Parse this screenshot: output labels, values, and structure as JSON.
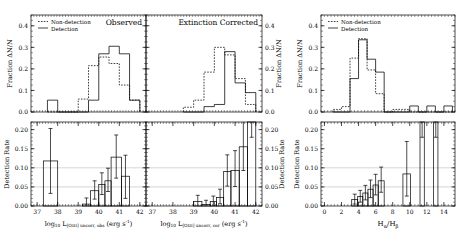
{
  "figure": {
    "width": 463,
    "height": 234,
    "background": "#ffffff",
    "axis_color": "#000000",
    "grid_color": "#bbbbbb",
    "nondetection_style": "dotted",
    "detection_style": "solid"
  },
  "legend": {
    "nondetection_label": "Non-detection",
    "detection_label": "Detection"
  },
  "panels": {
    "left": {
      "title": "Observed",
      "top": {
        "ylabel": "Fraction ΔN/N",
        "yticks": [
          "0.0",
          "0.1",
          "0.2",
          "0.3",
          "0.4"
        ],
        "ylim": [
          0.0,
          0.45
        ]
      },
      "bottom": {
        "ylabel": "Detection Rate",
        "yticks": [
          "0.00",
          "0.05",
          "0.10",
          "0.15",
          "0.20"
        ],
        "ylim": [
          0.0,
          0.22
        ],
        "gridlines": [
          0.05,
          0.1
        ]
      },
      "xlabel_main": "log",
      "xlabel_sub": "10",
      "xlabel_l": "L",
      "xlabel_lsub": "[OIII] uncorr, obs",
      "xlabel_unit": "(erg s",
      "xlabel_unitexp": "-1",
      "xlabel_unitend": ")",
      "xticks": [
        "37",
        "38",
        "39",
        "40",
        "41",
        "42"
      ],
      "xlim": [
        36.7,
        42.3
      ]
    },
    "middle": {
      "title": "Extinction Corrected",
      "top": {
        "ylabel": "Fraction ΔN/N",
        "yticks": [
          "0.0",
          "0.1",
          "0.2",
          "0.3",
          "0.4"
        ],
        "ylim": [
          0.0,
          0.45
        ]
      },
      "bottom": {
        "ylabel": "Detection Rate",
        "yticks": [
          "0.00",
          "0.05",
          "0.10",
          "0.15",
          "0.20"
        ],
        "ylim": [
          0.0,
          0.22
        ],
        "gridlines": [
          0.05,
          0.1
        ]
      },
      "xlabel_main": "log",
      "xlabel_sub": "10",
      "xlabel_l": "L",
      "xlabel_lsub": "[OIII] uncorr, cor",
      "xlabel_unit": "(erg s",
      "xlabel_unitexp": "-1",
      "xlabel_unitend": ")",
      "xticks": [
        "37",
        "38",
        "39",
        "40",
        "41",
        "42"
      ],
      "xlim": [
        36.7,
        42.3
      ]
    },
    "right": {
      "title": "",
      "top": {
        "ylabel": "Fraction ΔN/N",
        "yticks": [
          "0.0",
          "0.1",
          "0.2",
          "0.3",
          "0.4"
        ],
        "ylim": [
          0.0,
          0.45
        ]
      },
      "bottom": {
        "ylabel": "Detection Rate",
        "yticks": [
          "0.00",
          "0.05",
          "0.10",
          "0.15",
          "0.20"
        ],
        "ylim": [
          0.0,
          0.22
        ],
        "gridlines": [
          0.05,
          0.1
        ]
      },
      "xlabel_h": "H",
      "xlabel_hsub1": "α",
      "xlabel_slash": "/H",
      "xlabel_hsub2": "β",
      "xticks": [
        "0",
        "2",
        "4",
        "6",
        "8",
        "10",
        "12",
        "14"
      ],
      "xlim": [
        -0.4,
        15.3
      ]
    }
  },
  "chart_data": [
    {
      "type": "line",
      "id": "left-top-histogram",
      "title": "Observed",
      "xlabel": "log10 L[OIII] uncorr, obs (erg s-1)",
      "ylabel": "Fraction ΔN/N",
      "xlim": [
        36.7,
        42.3
      ],
      "ylim": [
        0.0,
        0.45
      ],
      "grid": false,
      "legend_position": "top-left",
      "bin_edges": [
        37.5,
        38.0,
        38.5,
        39.0,
        39.5,
        40.0,
        40.5,
        41.0,
        41.5,
        42.0
      ],
      "series": [
        {
          "name": "Non-detection",
          "style": "dotted",
          "values": [
            0.0,
            0.0,
            0.0,
            0.06,
            0.215,
            0.255,
            0.225,
            0.125,
            0.055
          ]
        },
        {
          "name": "Detection",
          "style": "solid",
          "values": [
            0.055,
            0.0,
            0.0,
            0.0,
            0.055,
            0.27,
            0.305,
            0.27,
            0.055
          ]
        }
      ]
    },
    {
      "type": "bar",
      "id": "left-bottom-detection-rate",
      "xlabel": "log10 L[OIII] uncorr, obs (erg s-1)",
      "ylabel": "Detection Rate",
      "xlim": [
        36.7,
        42.3
      ],
      "ylim": [
        0.0,
        0.22
      ],
      "grid": true,
      "gridlines": [
        0.05,
        0.1
      ],
      "bin_edges": [
        37.3,
        38.0,
        39.2,
        39.6,
        40.0,
        40.3,
        40.6,
        41.1,
        41.5
      ],
      "values": [
        0.118,
        0.0,
        0.005,
        0.04,
        0.056,
        0.066,
        0.128,
        0.078
      ],
      "err_low": [
        0.085,
        0.0,
        0.005,
        0.022,
        0.026,
        0.028,
        0.055,
        0.058
      ],
      "err_high": [
        0.085,
        0.0,
        0.016,
        0.026,
        0.031,
        0.033,
        0.058,
        0.055
      ]
    },
    {
      "type": "line",
      "id": "middle-top-histogram",
      "title": "Extinction Corrected",
      "xlabel": "log10 L[OIII] uncorr, cor (erg s-1)",
      "ylabel": "Fraction ΔN/N",
      "xlim": [
        36.7,
        42.3
      ],
      "ylim": [
        0.0,
        0.45
      ],
      "grid": false,
      "bin_edges": [
        38.5,
        39.0,
        39.5,
        40.0,
        40.5,
        41.0,
        41.5,
        42.0
      ],
      "series": [
        {
          "name": "Non-detection",
          "style": "dotted",
          "values": [
            0.022,
            0.055,
            0.185,
            0.3,
            0.265,
            0.155,
            0.035
          ]
        },
        {
          "name": "Detection",
          "style": "solid",
          "values": [
            0.0,
            0.0,
            0.025,
            0.035,
            0.28,
            0.135,
            0.09
          ]
        }
      ]
    },
    {
      "type": "bar",
      "id": "middle-bottom-detection-rate",
      "xlabel": "log10 L[OIII] uncorr, cor (erg s-1)",
      "ylabel": "Detection Rate",
      "xlim": [
        36.7,
        42.3
      ],
      "ylim": [
        0.0,
        0.22
      ],
      "grid": true,
      "gridlines": [
        0.05,
        0.1
      ],
      "bin_edges": [
        39.0,
        39.4,
        39.8,
        40.1,
        40.45,
        40.8,
        41.2,
        41.6,
        42.0
      ],
      "values": [
        0.012,
        0.004,
        0.012,
        0.022,
        0.09,
        0.093,
        0.155,
        0.3
      ],
      "err_low": [
        0.012,
        0.004,
        0.012,
        0.016,
        0.038,
        0.042,
        0.062,
        0.12
      ],
      "err_high": [
        0.016,
        0.011,
        0.014,
        0.022,
        0.044,
        0.052,
        0.075,
        0.14
      ]
    },
    {
      "type": "line",
      "id": "right-top-histogram",
      "xlabel": "Hα/Hβ",
      "ylabel": "Fraction ΔN/N",
      "xlim": [
        -0.4,
        15.3
      ],
      "ylim": [
        0.0,
        0.45
      ],
      "grid": false,
      "legend_position": "top-left",
      "bin_edges": [
        1.0,
        2.0,
        3.0,
        4.0,
        5.0,
        6.0,
        7.0,
        8.0,
        9.0,
        10.0,
        11.0,
        12.0,
        13.0,
        14.0,
        15.0
      ],
      "series": [
        {
          "name": "Non-detection",
          "style": "dotted",
          "values": [
            0.012,
            0.025,
            0.25,
            0.34,
            0.195,
            0.085,
            0.0,
            0.012,
            0.012,
            0.0,
            0.0,
            0.0,
            0.0,
            0.0
          ]
        },
        {
          "name": "Detection",
          "style": "solid",
          "values": [
            0.0,
            0.0,
            0.155,
            0.335,
            0.245,
            0.185,
            0.0,
            0.0,
            0.0,
            0.028,
            0.0,
            0.028,
            0.0,
            0.028
          ]
        }
      ]
    },
    {
      "type": "bar",
      "id": "right-bottom-detection-rate",
      "xlabel": "Hα/Hβ",
      "ylabel": "Detection Rate",
      "xlim": [
        -0.4,
        15.3
      ],
      "ylim": [
        0.0,
        0.22
      ],
      "grid": true,
      "gridlines": [
        0.05,
        0.1
      ],
      "bin_edges": [
        3.2,
        3.9,
        4.5,
        5.1,
        5.7,
        6.3,
        7.0,
        9.2,
        10.1,
        11.2,
        11.7,
        12.8,
        13.3,
        14.2
      ],
      "values": [
        0.017,
        0.025,
        0.034,
        0.044,
        0.055,
        0.066,
        0.0,
        0.084,
        0.0,
        0.3,
        0.0,
        0.3,
        0.0,
        0.3
      ],
      "err_low": [
        0.012,
        0.015,
        0.018,
        0.022,
        0.026,
        0.03,
        0.0,
        0.058,
        0.0,
        0.12,
        0.0,
        0.12,
        0.0,
        0.12
      ],
      "err_high": [
        0.014,
        0.016,
        0.02,
        0.024,
        0.028,
        0.036,
        0.0,
        0.085,
        0.0,
        0.12,
        0.0,
        0.12,
        0.0,
        0.12
      ]
    }
  ]
}
